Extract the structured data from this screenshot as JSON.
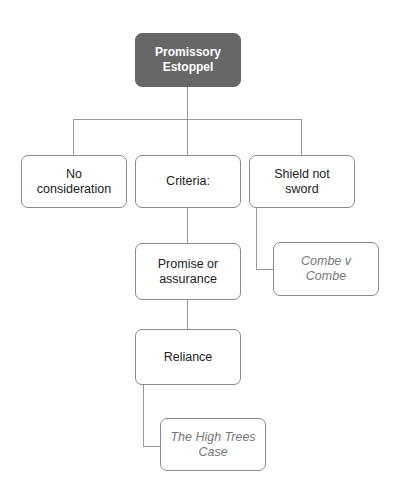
{
  "diagram": {
    "root": {
      "label": "Promissory\nEstoppel",
      "color": "#676767"
    },
    "children": [
      {
        "label": "No consideration"
      },
      {
        "label": "Criteria:"
      },
      {
        "label": "Shield not sword"
      }
    ],
    "criteria": [
      {
        "label": "Promise or assurance"
      },
      {
        "label": "Reliance"
      }
    ],
    "cases": [
      {
        "label": "Combe v Combe",
        "attached_to": "Shield not sword"
      },
      {
        "label": "The High Trees Case",
        "attached_to": "Reliance"
      }
    ]
  }
}
